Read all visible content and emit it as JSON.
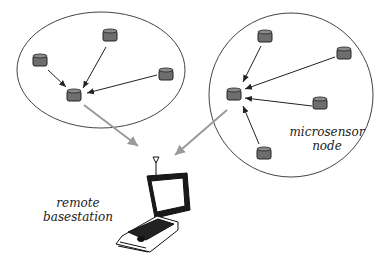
{
  "diagram": {
    "clusters": [
      {
        "name": "left-cluster",
        "shape": "ellipse",
        "node_count": 4
      },
      {
        "name": "right-cluster",
        "shape": "circle",
        "node_count": 5
      }
    ],
    "labels": {
      "microsensor_line1": "microsensor",
      "microsensor_line2": "node",
      "basestation_line1": "remote",
      "basestation_line2": "basestation"
    },
    "colors": {
      "node_fill": "#6e6e6e",
      "outline": "#333333",
      "uplink_arrow": "#9a9a9a",
      "sensor_arrow": "#222222"
    }
  }
}
